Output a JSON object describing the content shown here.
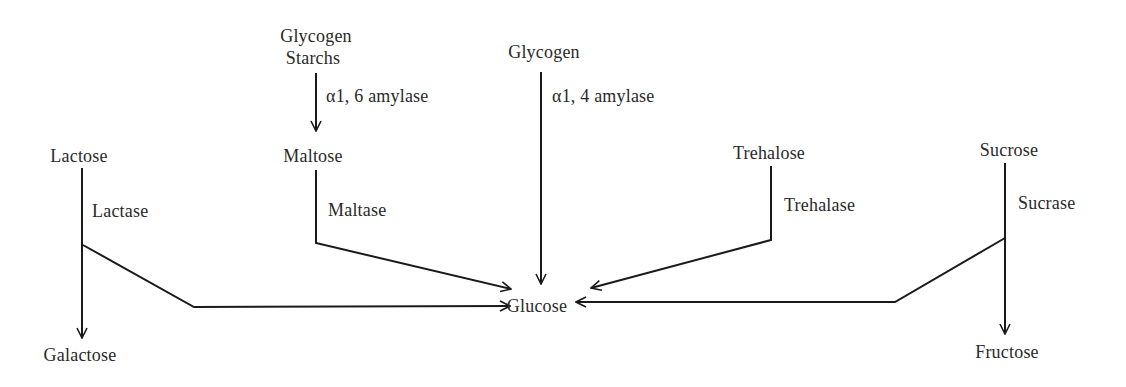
{
  "diagram": {
    "type": "carbohydrate digestion pathway",
    "nodes": {
      "glycogen_starchs_line1": "Glycogen",
      "glycogen_starchs_line2": "Starchs",
      "glycogen": "Glycogen",
      "lactose": "Lactose",
      "maltose": "Maltose",
      "trehalose": "Trehalose",
      "sucrose": "Sucrose",
      "glucose": "Glucose",
      "galactose": "Galactose",
      "fructose": "Fructose"
    },
    "enzymes": {
      "alpha16": "α1, 6 amylase",
      "alpha14": "α1, 4 amylase",
      "lactase": "Lactase",
      "maltase": "Maltase",
      "trehalase": "Trehalase",
      "sucrase": "Sucrase"
    },
    "edges": [
      {
        "from": "Glycogen/Starchs",
        "to": "Maltose",
        "enzyme": "α1, 6 amylase"
      },
      {
        "from": "Glycogen",
        "to": "Glucose",
        "enzyme": "α1, 4 amylase"
      },
      {
        "from": "Lactose",
        "to": "Galactose",
        "enzyme": "Lactase"
      },
      {
        "from": "Lactose",
        "to": "Glucose",
        "enzyme": "Lactase"
      },
      {
        "from": "Maltose",
        "to": "Glucose",
        "enzyme": "Maltase"
      },
      {
        "from": "Trehalose",
        "to": "Glucose",
        "enzyme": "Trehalase"
      },
      {
        "from": "Sucrose",
        "to": "Glucose",
        "enzyme": "Sucrase"
      },
      {
        "from": "Sucrose",
        "to": "Fructose",
        "enzyme": "Sucrase"
      }
    ],
    "line_color": "#1a1a1a"
  }
}
